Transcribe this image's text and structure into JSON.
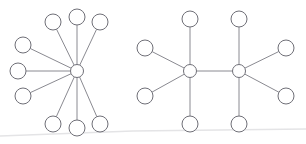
{
  "figure": {
    "title": "",
    "background_color": "#ffffff",
    "width": 306,
    "height": 144
  },
  "style": {
    "node_stroke_color": "#6f6f77",
    "node_fill_color": "#ffffff",
    "node_stroke_width": 1,
    "edge_stroke_color": "#8a8a91",
    "edge_stroke_width": 1,
    "leaf_radius": 8,
    "hub_radius": 6.5,
    "fold_line_color": "#e4e4e6"
  },
  "chart_data": {
    "type": "diagram",
    "subtype": "node-link-graph",
    "title": "",
    "xlabel": "",
    "ylabel": "",
    "graphs": [
      {
        "id": "star-graph",
        "label": "",
        "description": "star graph: one central hub with nine leaf nodes",
        "node_count": 10,
        "edge_count": 9,
        "nodes": [
          {
            "id": "L-hub",
            "role": "hub",
            "x": 77,
            "y": 71,
            "r": 6.5
          },
          {
            "id": "L-n1",
            "role": "leaf",
            "x": 53,
            "y": 22,
            "r": 8
          },
          {
            "id": "L-n2",
            "role": "leaf",
            "x": 77,
            "y": 17,
            "r": 8
          },
          {
            "id": "L-n3",
            "role": "leaf",
            "x": 100,
            "y": 22,
            "r": 8
          },
          {
            "id": "L-n4",
            "role": "leaf",
            "x": 23,
            "y": 45,
            "r": 8
          },
          {
            "id": "L-n5",
            "role": "leaf",
            "x": 18,
            "y": 71,
            "r": 8
          },
          {
            "id": "L-n6",
            "role": "leaf",
            "x": 23,
            "y": 96,
            "r": 8
          },
          {
            "id": "L-n7",
            "role": "leaf",
            "x": 53,
            "y": 124,
            "r": 8
          },
          {
            "id": "L-n8",
            "role": "leaf",
            "x": 77,
            "y": 128,
            "r": 8
          },
          {
            "id": "L-n9",
            "role": "leaf",
            "x": 100,
            "y": 124,
            "r": 8
          }
        ],
        "edges": [
          {
            "source": "L-hub",
            "target": "L-n1"
          },
          {
            "source": "L-hub",
            "target": "L-n2"
          },
          {
            "source": "L-hub",
            "target": "L-n3"
          },
          {
            "source": "L-hub",
            "target": "L-n4"
          },
          {
            "source": "L-hub",
            "target": "L-n5"
          },
          {
            "source": "L-hub",
            "target": "L-n6"
          },
          {
            "source": "L-hub",
            "target": "L-n7"
          },
          {
            "source": "L-hub",
            "target": "L-n8"
          },
          {
            "source": "L-hub",
            "target": "L-n9"
          }
        ]
      },
      {
        "id": "double-star-graph",
        "label": "",
        "description": "double star / barbell graph: two connected hubs, each with four leaf nodes",
        "node_count": 10,
        "edge_count": 9,
        "nodes": [
          {
            "id": "R-hubA",
            "role": "hub",
            "x": 190,
            "y": 71,
            "r": 6.5
          },
          {
            "id": "R-hubB",
            "role": "hub",
            "x": 239,
            "y": 71,
            "r": 6.5
          },
          {
            "id": "R-a1",
            "role": "leaf",
            "x": 190,
            "y": 19,
            "r": 8
          },
          {
            "id": "R-a2",
            "role": "leaf",
            "x": 190,
            "y": 124,
            "r": 8
          },
          {
            "id": "R-a3",
            "role": "leaf",
            "x": 145,
            "y": 48,
            "r": 8
          },
          {
            "id": "R-a4",
            "role": "leaf",
            "x": 145,
            "y": 96,
            "r": 8
          },
          {
            "id": "R-b1",
            "role": "leaf",
            "x": 239,
            "y": 19,
            "r": 8
          },
          {
            "id": "R-b2",
            "role": "leaf",
            "x": 239,
            "y": 124,
            "r": 8
          },
          {
            "id": "R-b3",
            "role": "leaf",
            "x": 286,
            "y": 48,
            "r": 8
          },
          {
            "id": "R-b4",
            "role": "leaf",
            "x": 286,
            "y": 96,
            "r": 8
          }
        ],
        "edges": [
          {
            "source": "R-hubA",
            "target": "R-hubB"
          },
          {
            "source": "R-hubA",
            "target": "R-a1"
          },
          {
            "source": "R-hubA",
            "target": "R-a2"
          },
          {
            "source": "R-hubA",
            "target": "R-a3"
          },
          {
            "source": "R-hubA",
            "target": "R-a4"
          },
          {
            "source": "R-hubB",
            "target": "R-b1"
          },
          {
            "source": "R-hubB",
            "target": "R-b2"
          },
          {
            "source": "R-hubB",
            "target": "R-b3"
          },
          {
            "source": "R-hubB",
            "target": "R-b4"
          }
        ]
      }
    ],
    "annotations": [
      {
        "id": "page-fold",
        "type": "line",
        "x1": 0,
        "y1": 136,
        "x2": 133,
        "y2": 131,
        "description": "faint scan fold line near bottom-left"
      },
      {
        "id": "page-fold-right",
        "type": "line",
        "x1": 133,
        "y1": 131,
        "x2": 306,
        "y2": 129,
        "description": "faint scan fold line continuing right"
      }
    ]
  }
}
